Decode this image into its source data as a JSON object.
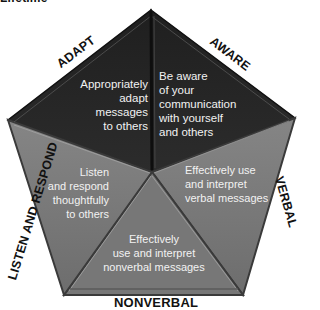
{
  "header": {
    "title": "Lifetime"
  },
  "colors": {
    "dark_segment": "#262626",
    "gray_segment": "#7a7a7a",
    "edge_highlight": "#9a9a9a",
    "text_on_segment": "#f2f2f2",
    "label_text": "#111111"
  },
  "segments": [
    {
      "id": "adapt",
      "label": "ADAPT",
      "text": [
        "Appropriately",
        "adapt",
        "messages",
        "to others"
      ]
    },
    {
      "id": "aware",
      "label": "AWARE",
      "text": [
        "Be aware",
        "of your",
        "communication",
        "with yourself",
        "and others"
      ]
    },
    {
      "id": "verbal",
      "label": "VERBAL",
      "text": [
        "Effectively use",
        "and interpret",
        "verbal messages"
      ]
    },
    {
      "id": "nonverbal",
      "label": "NONVERBAL",
      "text": [
        "Effectively",
        "use and interpret",
        "nonverbal messages"
      ]
    },
    {
      "id": "listen",
      "label": "LISTEN AND RESPOND",
      "text": [
        "Listen",
        "and respond",
        "thoughtfully",
        "to others"
      ]
    }
  ]
}
